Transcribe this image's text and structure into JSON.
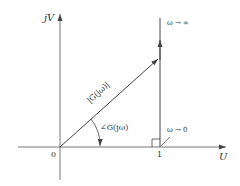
{
  "diagram": {
    "title": "",
    "axes": {
      "vertical_label": "jV",
      "horizontal_label": "U",
      "origin_label": "0",
      "unit_tick_label": "1"
    },
    "vector": {
      "magnitude_label": "|G(jω)|",
      "angle_label": "∠G(jω)"
    },
    "locus": {
      "top_label": "ω → ∞",
      "bottom_label": "ω → 0"
    },
    "colors": {
      "line": "#444444",
      "text": "#333333",
      "background": "#ffffff"
    }
  }
}
